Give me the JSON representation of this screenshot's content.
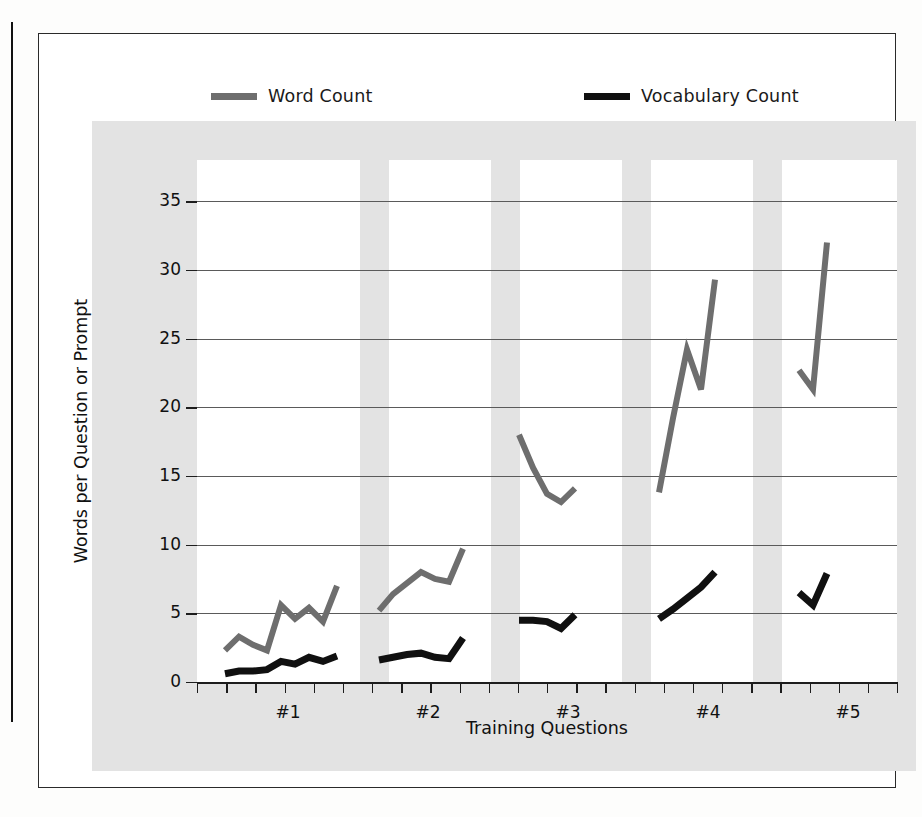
{
  "legend": {
    "entries": [
      {
        "label": "Word Count",
        "color": "#6e6e6e",
        "icon": "line-swatch-icon"
      },
      {
        "label": "Vocabulary Count",
        "color": "#101010",
        "icon": "line-swatch-icon"
      }
    ]
  },
  "axes": {
    "y_title": "Words per Question or Prompt",
    "x_title": "Training Questions",
    "y_ticks": [
      "0",
      "5",
      "10",
      "15",
      "20",
      "25",
      "30",
      "35"
    ],
    "x_ticks": [
      "#1",
      "#2",
      "#3",
      "#4",
      "#5"
    ]
  },
  "chart_data": {
    "type": "line",
    "title": "",
    "xlabel": "Training Questions",
    "ylabel": "Words per Question or Prompt",
    "ylim": [
      0,
      37
    ],
    "yticks": [
      0,
      5,
      10,
      15,
      20,
      25,
      30,
      35
    ],
    "grid": true,
    "legend_position": "top",
    "groups": [
      "#1",
      "#2",
      "#3",
      "#4",
      "#5"
    ],
    "x_group_centers": [
      6.5,
      16.5,
      26.5,
      36.5,
      46.5
    ],
    "series": [
      {
        "name": "Word Count",
        "color": "#6e6e6e",
        "segments": [
          {
            "group": "#1",
            "x": [
              2,
              3,
              4,
              5,
              6,
              7,
              8,
              9,
              10
            ],
            "values": [
              2.3,
              3.3,
              2.7,
              2.3,
              5.6,
              4.6,
              5.4,
              4.4,
              7.0
            ]
          },
          {
            "group": "#2",
            "x": [
              13,
              14,
              15,
              16,
              17,
              18,
              19
            ],
            "values": [
              5.2,
              6.4,
              7.2,
              8.0,
              7.5,
              7.3,
              9.7
            ]
          },
          {
            "group": "#3",
            "x": [
              23,
              24,
              25,
              26,
              27
            ],
            "values": [
              18.0,
              15.6,
              13.7,
              13.1,
              14.1
            ]
          },
          {
            "group": "#4",
            "x": [
              33,
              34,
              35,
              36,
              37
            ],
            "values": [
              13.8,
              19.2,
              24.2,
              21.3,
              29.3
            ]
          },
          {
            "group": "#5",
            "x": [
              43,
              44,
              45
            ],
            "values": [
              22.7,
              21.3,
              32.0
            ]
          }
        ]
      },
      {
        "name": "Vocabulary Count",
        "color": "#101010",
        "segments": [
          {
            "group": "#1",
            "x": [
              2,
              3,
              4,
              5,
              6,
              7,
              8,
              9,
              10
            ],
            "values": [
              0.6,
              0.8,
              0.8,
              0.9,
              1.5,
              1.3,
              1.8,
              1.5,
              1.9
            ]
          },
          {
            "group": "#2",
            "x": [
              13,
              14,
              15,
              16,
              17,
              18,
              19
            ],
            "values": [
              1.6,
              1.8,
              2.0,
              2.1,
              1.8,
              1.7,
              3.2
            ]
          },
          {
            "group": "#3",
            "x": [
              23,
              24,
              25,
              26,
              27
            ],
            "values": [
              4.5,
              4.5,
              4.4,
              3.9,
              4.9
            ]
          },
          {
            "group": "#4",
            "x": [
              33,
              34,
              35,
              36,
              37
            ],
            "values": [
              4.6,
              5.3,
              6.1,
              6.9,
              8.0
            ]
          },
          {
            "group": "#5",
            "x": [
              43,
              44,
              45
            ],
            "values": [
              6.5,
              5.6,
              7.9
            ]
          }
        ]
      }
    ]
  }
}
